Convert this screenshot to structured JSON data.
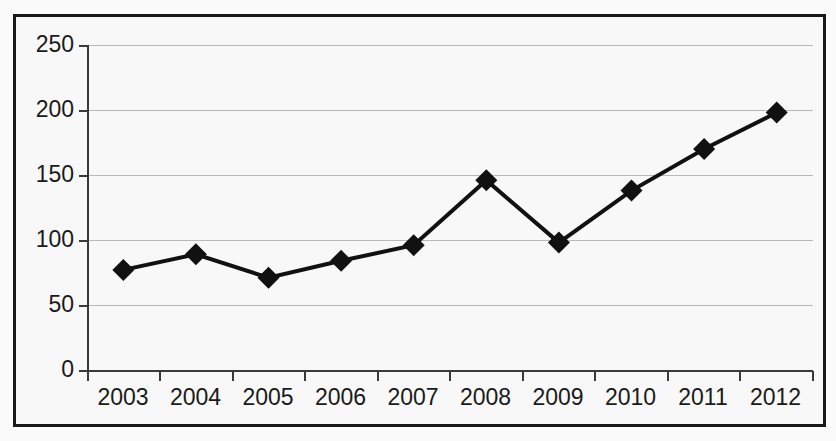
{
  "chart_data": {
    "type": "line",
    "title": "",
    "subtitle": "",
    "xlabel": "",
    "ylabel": "",
    "categories": [
      "2003",
      "2004",
      "2005",
      "2006",
      "2007",
      "2008",
      "2009",
      "2010",
      "2011",
      "2012"
    ],
    "values": [
      77,
      89,
      71,
      84,
      96,
      146,
      98,
      138,
      170,
      198
    ],
    "series": [
      {
        "name": "",
        "values": [
          77,
          89,
          71,
          84,
          96,
          146,
          98,
          138,
          170,
          198
        ]
      }
    ],
    "ylim": [
      0,
      250
    ],
    "yticks": [
      0,
      50,
      100,
      150,
      200,
      250
    ],
    "ytick_labels": [
      "0",
      "50",
      "100",
      "150",
      "200",
      "250"
    ],
    "grid": true,
    "grid_axis": "y",
    "legend": false,
    "legend_position": "none",
    "marker": "diamond",
    "marker_color": "#111111",
    "line_color": "#111111",
    "line_width": 4,
    "background_color": "#f8f8f8",
    "border_color": "#1a1a1a",
    "gridline_color": "#b9b9b9",
    "axis_color": "#3a3a3a",
    "annotations": []
  }
}
